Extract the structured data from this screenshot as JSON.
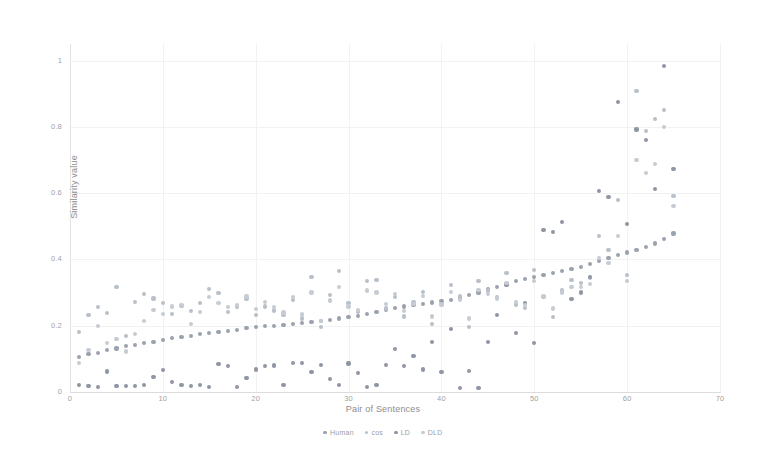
{
  "chart_data": {
    "type": "scatter",
    "title": "",
    "xlabel": "Pair of Sentences",
    "ylabel": "Similarity value",
    "xlim": [
      0,
      70
    ],
    "ylim": [
      0,
      1.05
    ],
    "xticks": [
      0,
      10,
      20,
      30,
      40,
      50,
      60,
      70
    ],
    "yticks": [
      0,
      0.2,
      0.4,
      0.6,
      0.8,
      1
    ],
    "xtick_labels": [
      "0",
      "10",
      "20",
      "30",
      "40",
      "50",
      "60",
      "70"
    ],
    "ytick_labels": [
      "0",
      "0.2",
      "0.4",
      "0.6",
      "0.8",
      "1"
    ],
    "grid": true,
    "legend_position": "bottom-center",
    "colors": {
      "Human": "#9aa2ae",
      "cos": "#b9c0c9",
      "LD": "#8e96a3",
      "DLD": "#c6ccd4"
    },
    "x": [
      1,
      2,
      3,
      4,
      5,
      6,
      7,
      8,
      9,
      10,
      11,
      12,
      13,
      14,
      15,
      16,
      17,
      18,
      19,
      20,
      21,
      22,
      23,
      24,
      25,
      26,
      27,
      28,
      29,
      30,
      31,
      32,
      33,
      34,
      35,
      36,
      37,
      38,
      39,
      40,
      41,
      42,
      43,
      44,
      45,
      46,
      47,
      48,
      49,
      50,
      51,
      52,
      53,
      54,
      55,
      56,
      57,
      58,
      59,
      60,
      61,
      62,
      63,
      64,
      65
    ],
    "series": [
      {
        "name": "Human",
        "color": "#9aa2ae",
        "values": [
          0.105,
          0.114,
          0.118,
          0.126,
          0.131,
          0.138,
          0.142,
          0.148,
          0.152,
          0.158,
          0.162,
          0.167,
          0.17,
          0.175,
          0.178,
          0.182,
          0.185,
          0.188,
          0.192,
          0.195,
          0.198,
          0.2,
          0.203,
          0.206,
          0.209,
          0.212,
          0.215,
          0.218,
          0.222,
          0.226,
          0.23,
          0.236,
          0.242,
          0.248,
          0.253,
          0.258,
          0.262,
          0.266,
          0.27,
          0.274,
          0.278,
          0.284,
          0.292,
          0.3,
          0.309,
          0.318,
          0.326,
          0.334,
          0.341,
          0.348,
          0.354,
          0.359,
          0.365,
          0.371,
          0.378,
          0.386,
          0.395,
          0.404,
          0.413,
          0.421,
          0.428,
          0.437,
          0.448,
          0.462,
          0.478
        ]
      },
      {
        "name": "cos",
        "color": "#b9c0c9",
        "values": [
          0.182,
          0.232,
          0.256,
          0.238,
          0.318,
          0.168,
          0.272,
          0.296,
          0.282,
          0.268,
          0.235,
          0.259,
          0.244,
          0.268,
          0.31,
          0.298,
          0.242,
          0.256,
          0.28,
          0.232,
          0.258,
          0.246,
          0.232,
          0.278,
          0.222,
          0.348,
          0.196,
          0.292,
          0.364,
          0.268,
          0.242,
          0.336,
          0.338,
          0.252,
          0.286,
          0.228,
          0.272,
          0.302,
          0.204,
          0.266,
          0.322,
          0.288,
          0.196,
          0.334,
          0.306,
          0.286,
          0.358,
          0.264,
          0.254,
          0.368,
          0.286,
          0.226,
          0.306,
          0.338,
          0.33,
          0.344,
          0.47,
          0.428,
          0.58,
          0.352,
          0.908,
          0.788,
          0.824,
          0.852,
          0.592
        ]
      },
      {
        "name": "LD",
        "color": "#8e96a3",
        "values": [
          0.022,
          0.018,
          0.015,
          0.062,
          0.017,
          0.018,
          0.019,
          0.022,
          0.046,
          0.066,
          0.03,
          0.022,
          0.018,
          0.02,
          0.016,
          0.085,
          0.079,
          0.016,
          0.042,
          0.068,
          0.078,
          0.08,
          0.022,
          0.088,
          0.088,
          0.06,
          0.082,
          0.038,
          0.02,
          0.086,
          0.058,
          0.015,
          0.02,
          0.082,
          0.13,
          0.078,
          0.108,
          0.068,
          0.152,
          0.06,
          0.19,
          0.012,
          0.064,
          0.012,
          0.15,
          0.232,
          0.322,
          0.178,
          0.268,
          0.148,
          0.488,
          0.482,
          0.512,
          0.28,
          0.3,
          0.348,
          0.606,
          0.588,
          0.876,
          0.508,
          0.792,
          0.76,
          0.612,
          0.984,
          0.672
        ]
      },
      {
        "name": "DLD",
        "color": "#c6ccd4",
        "values": [
          0.088,
          0.126,
          0.198,
          0.148,
          0.16,
          0.122,
          0.176,
          0.214,
          0.248,
          0.236,
          0.258,
          0.262,
          0.204,
          0.242,
          0.286,
          0.268,
          0.256,
          0.262,
          0.288,
          0.25,
          0.272,
          0.256,
          0.24,
          0.286,
          0.234,
          0.3,
          0.214,
          0.276,
          0.318,
          0.258,
          0.248,
          0.306,
          0.3,
          0.266,
          0.296,
          0.244,
          0.266,
          0.29,
          0.228,
          0.262,
          0.302,
          0.278,
          0.222,
          0.308,
          0.296,
          0.282,
          0.33,
          0.272,
          0.262,
          0.336,
          0.29,
          0.252,
          0.3,
          0.318,
          0.318,
          0.326,
          0.404,
          0.388,
          0.47,
          0.334,
          0.7,
          0.66,
          0.688,
          0.8,
          0.56
        ]
      }
    ],
    "legend": [
      {
        "label": "Human",
        "color": "#9aa2ae"
      },
      {
        "label": "cos",
        "color": "#b9c0c9"
      },
      {
        "label": "LD",
        "color": "#8e96a3"
      },
      {
        "label": "DLD",
        "color": "#c6ccd4"
      }
    ]
  }
}
